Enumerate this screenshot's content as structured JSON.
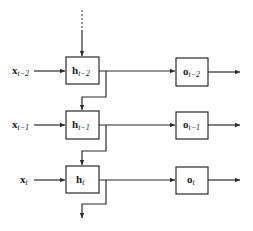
{
  "diagram": {
    "type": "recurrent-neural-network-unrolled",
    "colors": {
      "stroke": "#2a2a2a",
      "background": "#ffffff",
      "text": "#222222"
    },
    "rows": [
      {
        "input": {
          "base": "x",
          "sub": "t−2"
        },
        "hidden": {
          "base": "h",
          "sub": "t−2"
        },
        "output": {
          "base": "o",
          "sub": "t−2"
        }
      },
      {
        "input": {
          "base": "x",
          "sub": "t−1"
        },
        "hidden": {
          "base": "h",
          "sub": "t−1"
        },
        "output": {
          "base": "o",
          "sub": "t−1"
        }
      },
      {
        "input": {
          "base": "x",
          "sub": "t"
        },
        "hidden": {
          "base": "h",
          "sub": "t"
        },
        "output": {
          "base": "o",
          "sub": "t"
        }
      }
    ]
  }
}
